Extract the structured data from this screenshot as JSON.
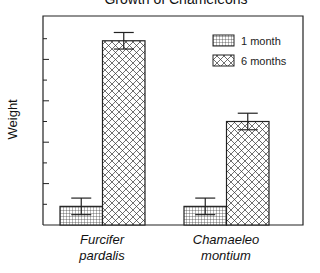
{
  "chart_data": {
    "type": "bar",
    "title": "Growth of Chameleons",
    "xlabel": "",
    "ylabel": "Weight",
    "categories": [
      "Furcifer pardalis",
      "Chamaeleo montium"
    ],
    "category_lines": [
      [
        "Furcifer",
        "pardalis"
      ],
      [
        "Chamaeleo",
        "montium"
      ]
    ],
    "series": [
      {
        "name": "1 month",
        "pattern": "grid",
        "values": [
          0.9,
          0.9
        ],
        "errors": [
          0.4,
          0.4
        ]
      },
      {
        "name": "6 months",
        "pattern": "crosshatch",
        "values": [
          8.9,
          5.0
        ],
        "errors": [
          0.4,
          0.4
        ]
      }
    ],
    "ylim": [
      0,
      10
    ],
    "yticks_labeled": false,
    "grid": false,
    "legend_position": "upper right"
  },
  "colors": {
    "ink": "#222222",
    "background": "#ffffff"
  }
}
